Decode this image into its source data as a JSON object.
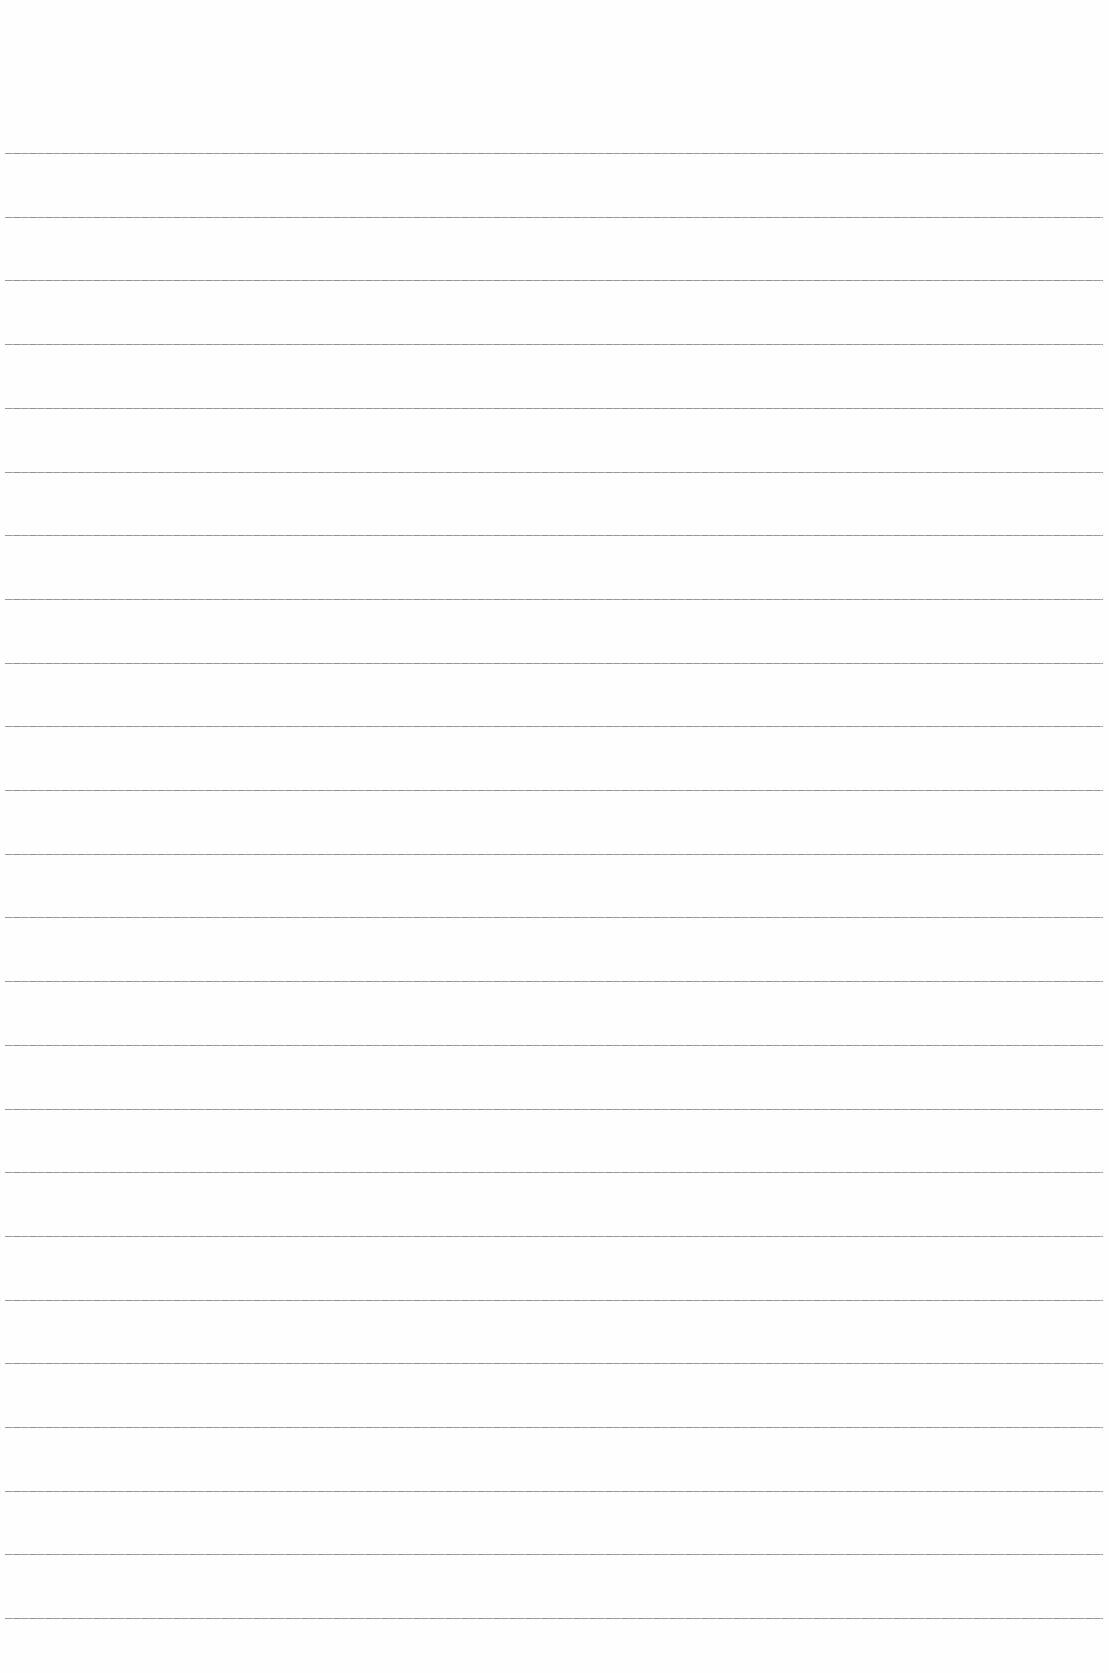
{
  "page": {
    "type": "ruled-paper",
    "background_color": "#fefefe",
    "rule_color": "#8a8a8a",
    "rule_count": 24,
    "first_rule_y": 153,
    "rule_spacing": 63.7,
    "rule_left": 5,
    "rule_right": 1103
  }
}
